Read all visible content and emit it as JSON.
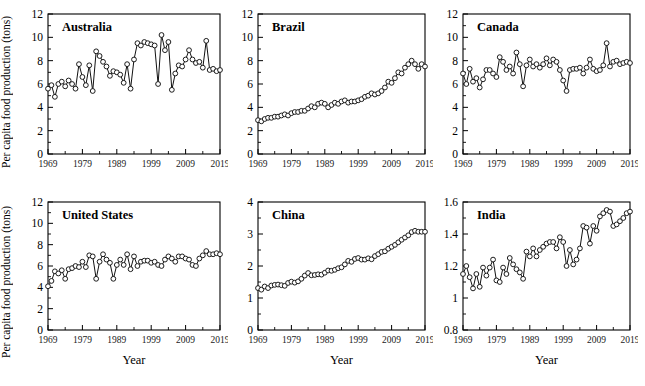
{
  "figure": {
    "ylabel": "Per capita food production (tons)",
    "xlabel": "Year",
    "x_tick_labels": [
      "1969",
      "1979",
      "1989",
      "1999",
      "2009",
      "2019"
    ],
    "line_color": "#111111",
    "marker_fill": "#ffffff",
    "background": "#ffffff"
  },
  "chart_data": [
    {
      "type": "line",
      "title": "Australia",
      "xlabel": "",
      "ylabel": "Per capita food production (tons)",
      "xlim": [
        1969,
        2019
      ],
      "ylim": [
        0,
        12
      ],
      "yticks": [
        0,
        2,
        4,
        6,
        8,
        10,
        12
      ],
      "ytick_labels": [
        "0",
        "2",
        "4",
        "6",
        "8",
        "10",
        "12"
      ],
      "xticks": [
        1969,
        1974,
        1979,
        1984,
        1989,
        1994,
        1999,
        2004,
        2009,
        2014,
        2019
      ],
      "xtick_labels": [
        "1969",
        "",
        "1979",
        "",
        "1989",
        "",
        "1999",
        "",
        "2009",
        "",
        "2019"
      ],
      "grid": false,
      "legend": "none",
      "markers": "open-circle",
      "x": [
        1969,
        1970,
        1971,
        1972,
        1973,
        1974,
        1975,
        1976,
        1977,
        1978,
        1979,
        1980,
        1981,
        1982,
        1983,
        1984,
        1985,
        1986,
        1987,
        1988,
        1989,
        1990,
        1991,
        1992,
        1993,
        1994,
        1995,
        1996,
        1997,
        1998,
        1999,
        2000,
        2001,
        2002,
        2003,
        2004,
        2005,
        2006,
        2007,
        2008,
        2009,
        2010,
        2011,
        2012,
        2013,
        2014,
        2015,
        2016,
        2017,
        2018,
        2019
      ],
      "values": [
        5.6,
        5.9,
        4.9,
        6.0,
        6.2,
        5.8,
        6.3,
        6.0,
        5.6,
        7.7,
        6.6,
        5.9,
        7.6,
        5.4,
        8.8,
        8.4,
        7.9,
        7.5,
        6.7,
        7.1,
        7.0,
        6.8,
        6.1,
        7.7,
        5.6,
        8.1,
        9.5,
        9.3,
        9.6,
        9.5,
        9.4,
        9.3,
        6.0,
        10.2,
        8.9,
        9.6,
        5.5,
        6.9,
        7.6,
        7.5,
        8.1,
        8.9,
        8.1,
        7.8,
        7.9,
        7.4,
        9.7,
        7.2,
        7.3,
        7.1,
        7.2
      ]
    },
    {
      "type": "line",
      "title": "Brazil",
      "xlabel": "",
      "ylabel": "",
      "xlim": [
        1969,
        2019
      ],
      "ylim": [
        0,
        12
      ],
      "yticks": [
        0,
        2,
        4,
        6,
        8,
        10,
        12
      ],
      "ytick_labels": [
        "0",
        "2",
        "4",
        "6",
        "8",
        "10",
        "12"
      ],
      "xticks": [
        1969,
        1974,
        1979,
        1984,
        1989,
        1994,
        1999,
        2004,
        2009,
        2014,
        2019
      ],
      "xtick_labels": [
        "1969",
        "",
        "1979",
        "",
        "1989",
        "",
        "1999",
        "",
        "2009",
        "",
        "2019"
      ],
      "grid": false,
      "legend": "none",
      "markers": "open-circle",
      "x": [
        1969,
        1970,
        1971,
        1972,
        1973,
        1974,
        1975,
        1976,
        1977,
        1978,
        1979,
        1980,
        1981,
        1982,
        1983,
        1984,
        1985,
        1986,
        1987,
        1988,
        1989,
        1990,
        1991,
        1992,
        1993,
        1994,
        1995,
        1996,
        1997,
        1998,
        1999,
        2000,
        2001,
        2002,
        2003,
        2004,
        2005,
        2006,
        2007,
        2008,
        2009,
        2010,
        2011,
        2012,
        2013,
        2014,
        2015,
        2016,
        2017,
        2018,
        2019
      ],
      "values": [
        2.9,
        2.8,
        3.0,
        3.1,
        3.1,
        3.2,
        3.2,
        3.3,
        3.4,
        3.3,
        3.5,
        3.6,
        3.6,
        3.7,
        3.7,
        3.9,
        4.1,
        4.0,
        4.3,
        4.4,
        4.3,
        4.0,
        4.2,
        4.4,
        4.3,
        4.5,
        4.6,
        4.4,
        4.5,
        4.5,
        4.6,
        4.7,
        4.9,
        5.0,
        5.2,
        5.1,
        5.2,
        5.4,
        5.7,
        6.2,
        6.1,
        6.5,
        7.0,
        6.9,
        7.4,
        7.7,
        8.0,
        7.7,
        7.3,
        7.7,
        7.5
      ]
    },
    {
      "type": "line",
      "title": "Canada",
      "xlabel": "",
      "ylabel": "",
      "xlim": [
        1969,
        2019
      ],
      "ylim": [
        0,
        12
      ],
      "yticks": [
        0,
        2,
        4,
        6,
        8,
        10,
        12
      ],
      "ytick_labels": [
        "0",
        "2",
        "4",
        "6",
        "8",
        "10",
        "12"
      ],
      "xticks": [
        1969,
        1974,
        1979,
        1984,
        1989,
        1994,
        1999,
        2004,
        2009,
        2014,
        2019
      ],
      "xtick_labels": [
        "1969",
        "",
        "1979",
        "",
        "1989",
        "",
        "1999",
        "",
        "2009",
        "",
        "2019"
      ],
      "grid": false,
      "legend": "none",
      "markers": "open-circle",
      "x": [
        1969,
        1970,
        1971,
        1972,
        1973,
        1974,
        1975,
        1976,
        1977,
        1978,
        1979,
        1980,
        1981,
        1982,
        1983,
        1984,
        1985,
        1986,
        1987,
        1988,
        1989,
        1990,
        1991,
        1992,
        1993,
        1994,
        1995,
        1996,
        1997,
        1998,
        1999,
        2000,
        2001,
        2002,
        2003,
        2004,
        2005,
        2006,
        2007,
        2008,
        2009,
        2010,
        2011,
        2012,
        2013,
        2014,
        2015,
        2016,
        2017,
        2018,
        2019
      ],
      "values": [
        6.9,
        6.0,
        7.3,
        6.2,
        6.5,
        5.7,
        6.4,
        7.2,
        7.2,
        6.9,
        6.6,
        8.3,
        7.9,
        7.2,
        7.5,
        6.9,
        8.7,
        7.7,
        5.8,
        7.6,
        8.1,
        7.5,
        7.7,
        7.4,
        7.7,
        8.2,
        7.6,
        8.1,
        7.9,
        7.2,
        6.3,
        5.4,
        7.2,
        7.3,
        7.3,
        7.4,
        6.9,
        7.4,
        8.1,
        7.3,
        7.1,
        7.2,
        7.6,
        9.5,
        7.5,
        7.9,
        8.0,
        7.7,
        7.8,
        7.9,
        7.8
      ]
    },
    {
      "type": "line",
      "title": "United States",
      "xlabel": "Year",
      "ylabel": "Per capita food production (tons)",
      "xlim": [
        1969,
        2019
      ],
      "ylim": [
        0,
        12
      ],
      "yticks": [
        0,
        2,
        4,
        6,
        8,
        10,
        12
      ],
      "ytick_labels": [
        "0",
        "2",
        "4",
        "6",
        "8",
        "10",
        "12"
      ],
      "xticks": [
        1969,
        1974,
        1979,
        1984,
        1989,
        1994,
        1999,
        2004,
        2009,
        2014,
        2019
      ],
      "xtick_labels": [
        "1969",
        "",
        "1979",
        "",
        "1989",
        "",
        "1999",
        "",
        "2009",
        "",
        "2019"
      ],
      "grid": false,
      "legend": "none",
      "markers": "open-circle",
      "x": [
        1969,
        1970,
        1971,
        1972,
        1973,
        1974,
        1975,
        1976,
        1977,
        1978,
        1979,
        1980,
        1981,
        1982,
        1983,
        1984,
        1985,
        1986,
        1987,
        1988,
        1989,
        1990,
        1991,
        1992,
        1993,
        1994,
        1995,
        1996,
        1997,
        1998,
        1999,
        2000,
        2001,
        2002,
        2003,
        2004,
        2005,
        2006,
        2007,
        2008,
        2009,
        2010,
        2011,
        2012,
        2013,
        2014,
        2015,
        2016,
        2017,
        2018,
        2019
      ],
      "values": [
        4.1,
        4.6,
        5.5,
        5.3,
        5.6,
        4.8,
        5.7,
        5.8,
        6.0,
        5.9,
        6.4,
        5.9,
        7.0,
        6.9,
        4.8,
        6.4,
        7.1,
        6.6,
        6.3,
        4.8,
        6.1,
        6.6,
        6.1,
        7.1,
        5.7,
        6.9,
        6.0,
        6.4,
        6.5,
        6.5,
        6.3,
        6.4,
        6.1,
        6.0,
        6.6,
        6.9,
        6.7,
        6.4,
        6.9,
        6.9,
        6.7,
        6.6,
        6.1,
        6.0,
        6.7,
        7.0,
        7.4,
        7.1,
        7.1,
        7.2,
        7.1
      ]
    },
    {
      "type": "line",
      "title": "China",
      "xlabel": "Year",
      "ylabel": "",
      "xlim": [
        1969,
        2019
      ],
      "ylim": [
        0,
        4
      ],
      "yticks": [
        0,
        1,
        2,
        3,
        4
      ],
      "ytick_labels": [
        "0",
        "1",
        "2",
        "3",
        "4"
      ],
      "xticks": [
        1969,
        1974,
        1979,
        1984,
        1989,
        1994,
        1999,
        2004,
        2009,
        2014,
        2019
      ],
      "xtick_labels": [
        "1969",
        "",
        "1979",
        "",
        "1989",
        "",
        "1999",
        "",
        "2009",
        "",
        "2019"
      ],
      "grid": false,
      "legend": "none",
      "markers": "open-circle",
      "x": [
        1969,
        1970,
        1971,
        1972,
        1973,
        1974,
        1975,
        1976,
        1977,
        1978,
        1979,
        1980,
        1981,
        1982,
        1983,
        1984,
        1985,
        1986,
        1987,
        1988,
        1989,
        1990,
        1991,
        1992,
        1993,
        1994,
        1995,
        1996,
        1997,
        1998,
        1999,
        2000,
        2001,
        2002,
        2003,
        2004,
        2005,
        2006,
        2007,
        2008,
        2009,
        2010,
        2011,
        2012,
        2013,
        2014,
        2015,
        2016,
        2017,
        2018,
        2019
      ],
      "values": [
        1.31,
        1.26,
        1.36,
        1.31,
        1.39,
        1.41,
        1.42,
        1.4,
        1.38,
        1.47,
        1.51,
        1.48,
        1.52,
        1.6,
        1.7,
        1.78,
        1.71,
        1.72,
        1.74,
        1.73,
        1.79,
        1.86,
        1.85,
        1.88,
        1.93,
        1.96,
        2.05,
        2.16,
        2.13,
        2.22,
        2.25,
        2.2,
        2.2,
        2.24,
        2.21,
        2.31,
        2.37,
        2.44,
        2.46,
        2.54,
        2.6,
        2.66,
        2.74,
        2.82,
        2.89,
        2.96,
        3.06,
        3.1,
        3.07,
        3.07,
        3.07
      ]
    },
    {
      "type": "line",
      "title": "India",
      "xlabel": "Year",
      "ylabel": "",
      "xlim": [
        1969,
        2019
      ],
      "ylim": [
        0.8,
        1.6
      ],
      "yticks": [
        0.8,
        1.0,
        1.2,
        1.4,
        1.6
      ],
      "ytick_labels": [
        "0.8",
        "1",
        "1.2",
        "1.4",
        "1.6"
      ],
      "xticks": [
        1969,
        1974,
        1979,
        1984,
        1989,
        1994,
        1999,
        2004,
        2009,
        2014,
        2019
      ],
      "xtick_labels": [
        "1969",
        "",
        "1979",
        "",
        "1989",
        "",
        "1999",
        "",
        "2009",
        "",
        "2019"
      ],
      "grid": false,
      "legend": "none",
      "markers": "open-circle",
      "x": [
        1969,
        1970,
        1971,
        1972,
        1973,
        1974,
        1975,
        1976,
        1977,
        1978,
        1979,
        1980,
        1981,
        1982,
        1983,
        1984,
        1985,
        1986,
        1987,
        1988,
        1989,
        1990,
        1991,
        1992,
        1993,
        1994,
        1995,
        1996,
        1997,
        1998,
        1999,
        2000,
        2001,
        2002,
        2003,
        2004,
        2005,
        2006,
        2007,
        2008,
        2009,
        2010,
        2011,
        2012,
        2013,
        2014,
        2015,
        2016,
        2017,
        2018,
        2019
      ],
      "values": [
        1.15,
        1.2,
        1.13,
        1.06,
        1.15,
        1.07,
        1.19,
        1.14,
        1.19,
        1.24,
        1.11,
        1.1,
        1.19,
        1.15,
        1.25,
        1.21,
        1.18,
        1.16,
        1.12,
        1.29,
        1.26,
        1.31,
        1.26,
        1.3,
        1.32,
        1.34,
        1.35,
        1.35,
        1.31,
        1.38,
        1.35,
        1.2,
        1.3,
        1.21,
        1.24,
        1.31,
        1.45,
        1.44,
        1.34,
        1.45,
        1.42,
        1.51,
        1.53,
        1.55,
        1.54,
        1.45,
        1.46,
        1.48,
        1.5,
        1.53,
        1.54
      ]
    }
  ]
}
